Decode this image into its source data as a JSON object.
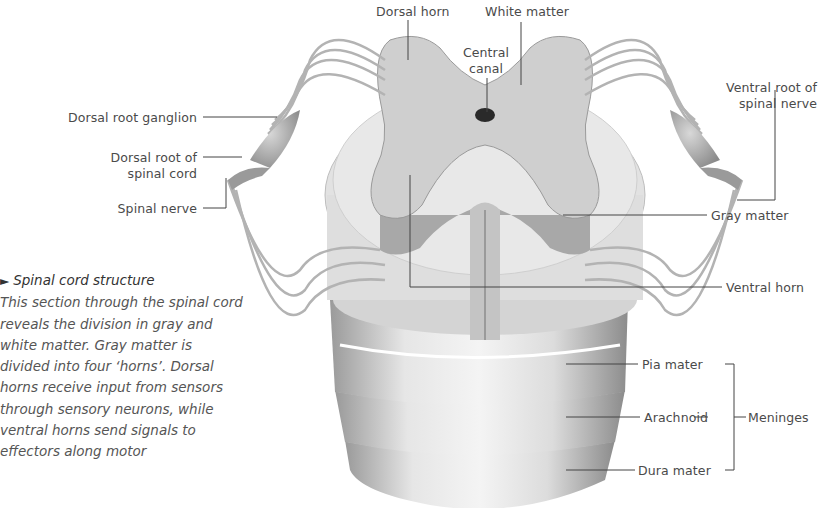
{
  "diagram": {
    "labels": {
      "dorsal_horn": "Dorsal horn",
      "white_matter": "White matter",
      "central_canal_1": "Central",
      "central_canal_2": "canal",
      "dorsal_root_ganglion": "Dorsal root ganglion",
      "dorsal_root_1": "Dorsal root of",
      "dorsal_root_2": "spinal cord",
      "spinal_nerve": "Spinal nerve",
      "ventral_root_1": "Ventral root of",
      "ventral_root_2": "spinal nerve",
      "gray_matter": "Gray matter",
      "ventral_horn": "Ventral horn",
      "pia_mater": "Pia mater",
      "arachnoid": "Arachnoid",
      "dura_mater": "Dura mater",
      "meninges": "Meninges"
    },
    "caption": {
      "marker": "►",
      "title": "Spinal cord structure",
      "body": "This section through the spinal cord reveals the division in gray and white matter. Gray matter is divided into four ‘horns’. Dorsal horns receive input from sensors through sensory neurons, while ventral horns send signals to effectors along motor"
    }
  }
}
